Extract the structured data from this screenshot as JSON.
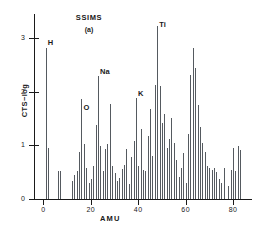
{
  "chart_data": {
    "type": "bar",
    "title": "SSIMS",
    "subtitle": "(a)",
    "xlabel": "AMU",
    "ylabel": "CTS−log",
    "xlim": [
      -4,
      88
    ],
    "ylim": [
      0,
      3.45
    ],
    "grid": false,
    "legend": null,
    "xticks": [
      0,
      20,
      40,
      60,
      80
    ],
    "xticklabels": [
      "0",
      "20",
      "40",
      "60",
      "80"
    ],
    "yticks": [
      0,
      1,
      2,
      3
    ],
    "yticklabels": [
      "0",
      "1",
      "2",
      "3"
    ],
    "annotations": [
      {
        "text": "H",
        "x": 1,
        "y": 2.93
      },
      {
        "text": "O",
        "x": 16,
        "y": 1.72
      },
      {
        "text": "Na",
        "x": 23,
        "y": 2.38
      },
      {
        "text": "K",
        "x": 39,
        "y": 1.98
      },
      {
        "text": "Ti",
        "x": 48,
        "y": 3.27
      },
      {
        "text": "SSIMS",
        "x": 24,
        "y": 3.45
      },
      {
        "text": "(a)",
        "x": 24,
        "y": 3.22
      }
    ],
    "x": [
      1,
      2,
      6,
      7,
      12,
      13,
      14,
      15,
      16,
      17,
      18,
      19,
      20,
      21,
      22,
      23,
      24,
      25,
      26,
      27,
      28,
      29,
      30,
      31,
      32,
      33,
      34,
      35,
      36,
      37,
      38,
      39,
      40,
      41,
      42,
      43,
      44,
      45,
      46,
      47,
      48,
      49,
      50,
      51,
      52,
      53,
      54,
      55,
      56,
      57,
      58,
      59,
      60,
      61,
      62,
      63,
      64,
      65,
      66,
      67,
      68,
      69,
      70,
      71,
      72,
      73,
      74,
      75,
      76,
      78,
      79,
      80,
      81,
      82,
      83
    ],
    "values": [
      2.82,
      0.95,
      0.53,
      0.52,
      0.33,
      0.45,
      0.52,
      0.88,
      1.87,
      1.02,
      0.58,
      0.3,
      0.37,
      0.62,
      1.38,
      2.3,
      0.98,
      0.52,
      0.93,
      1.02,
      1.78,
      0.61,
      0.49,
      0.33,
      0.4,
      0.56,
      0.63,
      0.93,
      0.28,
      0.78,
      1.08,
      1.88,
      0.62,
      1.3,
      0.55,
      0.52,
      1.18,
      1.68,
      0.81,
      2.12,
      3.22,
      2.1,
      1.42,
      1.58,
      0.96,
      1.12,
      1.52,
      1.05,
      0.72,
      0.41,
      0.58,
      0.86,
      0.3,
      1.22,
      2.32,
      2.82,
      2.45,
      1.76,
      1.35,
      1.05,
      0.88,
      0.62,
      0.58,
      0.55,
      0.58,
      0.5,
      0.38,
      0.3,
      0.58,
      0.25,
      0.55,
      0.95,
      0.52,
      0.98,
      0.92
    ]
  }
}
